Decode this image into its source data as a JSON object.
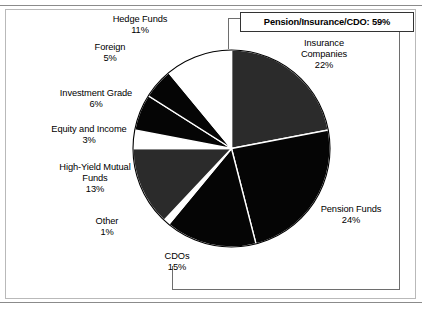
{
  "chart_data": {
    "type": "pie",
    "title": "",
    "subtitle": "",
    "xlabel": "",
    "ylabel": "",
    "legend_position": "none",
    "grid": false,
    "units": "percent",
    "start_angle_deg": 0,
    "direction": "clockwise",
    "categories": [
      "Insurance Companies",
      "Pension Funds",
      "CDOs",
      "Other",
      "High-Yield Mutual Funds",
      "Equity and Income",
      "Investment Grade",
      "Foreign",
      "Hedge Funds"
    ],
    "values": [
      22,
      24,
      15,
      1,
      13,
      3,
      6,
      5,
      11
    ],
    "slices": [
      {
        "label": "Insurance Companies",
        "value": 22,
        "value_text": "22%",
        "color": "#2b2b2b"
      },
      {
        "label": "Pension Funds",
        "value": 24,
        "value_text": "24%",
        "color": "#050505"
      },
      {
        "label": "CDOs",
        "value": 15,
        "value_text": "15%",
        "color": "#050505"
      },
      {
        "label": "Other",
        "value": 1,
        "value_text": "1%",
        "color": "#ffffff"
      },
      {
        "label": "High-Yield Mutual Funds",
        "value": 13,
        "value_text": "13%",
        "color": "#2b2b2b"
      },
      {
        "label": "Equity and Income",
        "value": 3,
        "value_text": "3%",
        "color": "#ffffff"
      },
      {
        "label": "Investment Grade",
        "value": 6,
        "value_text": "6%",
        "color": "#050505"
      },
      {
        "label": "Foreign",
        "value": 5,
        "value_text": "5%",
        "color": "#050505"
      },
      {
        "label": "Hedge Funds",
        "value": 11,
        "value_text": "11%",
        "color": "#ffffff"
      }
    ],
    "annotations": [
      {
        "text": "Pension/Insurance/CDO: 59%",
        "covers": [
          "Pension Funds",
          "Insurance Companies",
          "CDOs"
        ],
        "value": 59
      }
    ]
  },
  "labels": {
    "hedge_funds": "Hedge Funds\n11%",
    "foreign": "Foreign\n5%",
    "investment_grade": "Investment Grade\n6%",
    "equity_and_income": "Equity and Income\n3%",
    "high_yield_mutual_funds": "High-Yield Mutual\nFunds\n13%",
    "other": "Other\n1%",
    "cdos": "CDOs\n15%",
    "insurance_companies": "Insurance\nCompanies\n22%",
    "pension_funds": "Pension Funds\n24%"
  },
  "callout": {
    "text": "Pension/Insurance/CDO: 59%"
  },
  "colors": {
    "slice_black": "#050505",
    "slice_gray": "#2b2b2b",
    "slice_white": "#ffffff",
    "outline": "#000000",
    "leader_line": "#6e6e6e",
    "rule": "#8b8b8b",
    "panel_border": "#b9b9b9"
  }
}
